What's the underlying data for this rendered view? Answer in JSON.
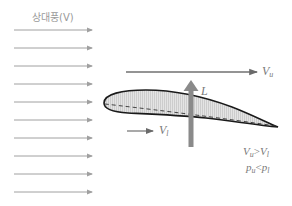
{
  "title": "상대풍(V)",
  "labels": {
    "upper_velocity": "V",
    "upper_velocity_sub": "u",
    "lower_velocity": "V",
    "lower_velocity_sub": "l",
    "lift": "L",
    "relation_velocity": "Vu > Vl",
    "relation_pressure": "pu < pl"
  },
  "relation": {
    "v_left": "V",
    "v_left_sub": "u",
    "v_op": ">",
    "v_right": "V",
    "v_right_sub": "l",
    "p_left": "p",
    "p_left_sub": "u",
    "p_op": "<",
    "p_right": "p",
    "p_right_sub": "l"
  },
  "colors": {
    "wind_arrow": "#a0a0a0",
    "airfoil_outline": "#1a1a1a",
    "airfoil_fill": "#d8d8d8",
    "lift_arrow": "#888888",
    "text": "#8a8a8a"
  },
  "wind_arrows": {
    "count": 10,
    "x_start": 14,
    "x_end": 92,
    "y_start": 30,
    "spacing": 18
  }
}
